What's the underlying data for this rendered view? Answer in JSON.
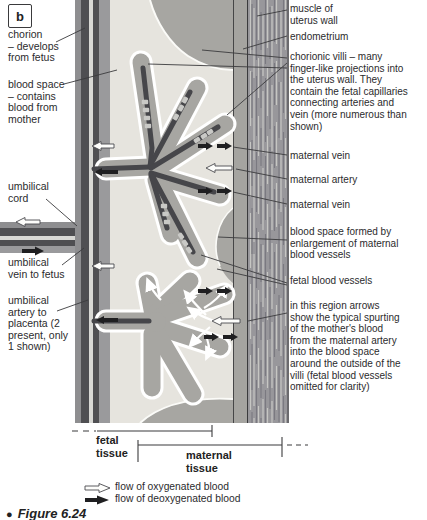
{
  "panel": {
    "label": "b"
  },
  "labels": {
    "chorion": "chorion\n– develops\nfrom fetus",
    "blood_space": "blood space\n– contains\nblood from\nmother",
    "umbilical_cord": "umbilical\ncord",
    "umbilical_vein": "umbilical\nvein to fetus",
    "umbilical_artery": "umbilical\nartery to\nplacenta (2\npresent, only\n1 shown)",
    "muscle": "muscle of\nuterus wall",
    "endometrium": "endometrium",
    "chorionic_villi": "chorionic villi – many\nfinger-like projections into\nthe uterus wall. They\ncontain the fetal capillaries\nconnecting arteries and\nvein (more numerous than\nshown)",
    "maternal_vein_1": "maternal vein",
    "maternal_artery": "maternal artery",
    "maternal_vein_2": "maternal vein",
    "blood_space_formed": "blood space formed by\nenlargement of maternal\nblood vessels",
    "fetal_blood_vessels": "fetal blood vessels",
    "spurting_note": "in this region arrows\nshow the typical spurting\nof the mother's blood\nfrom the maternal artery\ninto the blood space\naround the outside of the\nvilli (fetal blood vessels\nomitted for clarity)"
  },
  "scale": {
    "fetal": "fetal\ntissue",
    "maternal": "maternal\ntissue"
  },
  "legend": {
    "oxygenated": "flow of oxygenated blood",
    "deoxygenated": "flow of deoxygenated blood"
  },
  "caption": {
    "bullet": "●",
    "text": "Figure 6.24"
  },
  "colors": {
    "tissue_gray": "#a7a6a2",
    "blood_space_cream": "#e6e4de",
    "vessel_dark": "#4f4f52",
    "muscle_band": "#98979b",
    "villus_outline": "#ffffff"
  }
}
